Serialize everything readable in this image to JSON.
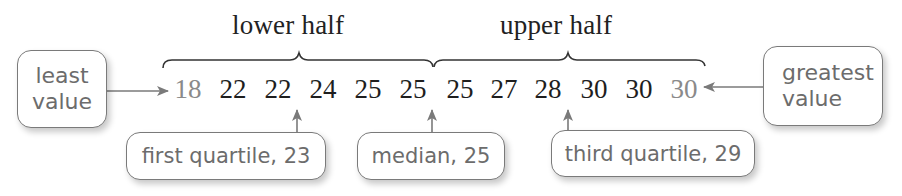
{
  "labels": {
    "lower_half": "lower half",
    "upper_half": "upper half"
  },
  "data_values": [
    "18",
    "22",
    "22",
    "24",
    "25",
    "25",
    "25",
    "27",
    "28",
    "30",
    "30",
    "30"
  ],
  "callouts": {
    "least_value": {
      "line1": "least",
      "line2": "value"
    },
    "greatest_value": {
      "line1": "greatest",
      "line2": "value"
    },
    "first_quartile": "first quartile, 23",
    "median": "median, 25",
    "third_quartile": "third quartile, 29"
  },
  "statistics": {
    "least_value": 18,
    "first_quartile": 23,
    "median": 25,
    "third_quartile": 29,
    "greatest_value": 30
  },
  "colors": {
    "text_dark": "#1e1e1e",
    "text_faded": "#8a8a8a",
    "callout_text": "#6c6c6c",
    "arrow": "#7a7a7a",
    "bracket": "#333333"
  }
}
